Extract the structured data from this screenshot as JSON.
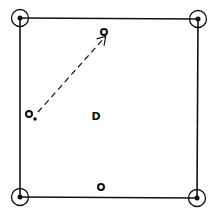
{
  "diagram": {
    "colors": {
      "ink": "#111111",
      "background": "#ffffff"
    },
    "corners": [
      {
        "id": "top-left",
        "symbol": "circled-dot"
      },
      {
        "id": "top-right",
        "symbol": "circled-dot"
      },
      {
        "id": "bottom-left",
        "symbol": "circled-dot"
      },
      {
        "id": "bottom-right",
        "symbol": "circled-dot"
      }
    ],
    "markers": [
      {
        "id": "top-center-target",
        "symbol": "open-circle"
      },
      {
        "id": "left-start",
        "symbol": "open-circle"
      },
      {
        "id": "left-start-dot",
        "symbol": "dot"
      },
      {
        "id": "bottom-center",
        "symbol": "open-circle"
      }
    ],
    "arrow": {
      "style": "dashed",
      "from": "left-start",
      "to": "top-center-target"
    },
    "center_label": "D"
  }
}
